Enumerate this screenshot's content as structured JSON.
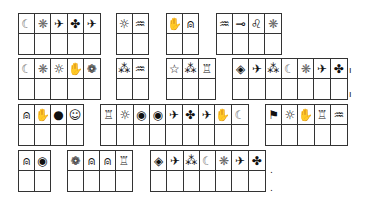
{
  "puzzle": {
    "cell_width": 16.6,
    "cell_height": 21,
    "boxes": [
      {
        "x": 18,
        "y": 13,
        "symbols": [
          "moon",
          "snowflake",
          "airplane",
          "clover",
          "airplane"
        ]
      },
      {
        "x": 116,
        "y": 13,
        "symbols": [
          "sun",
          "waves"
        ]
      },
      {
        "x": 166,
        "y": 13,
        "symbols": [
          "hand",
          "bell"
        ]
      },
      {
        "x": 216,
        "y": 13,
        "symbols": [
          "waves",
          "key",
          "leo",
          "snowflake"
        ]
      },
      {
        "x": 18,
        "y": 58,
        "symbols": [
          "moon",
          "snowflake",
          "sun",
          "hand",
          "flower"
        ]
      },
      {
        "x": 116,
        "y": 58,
        "symbols": [
          "three-stars",
          "waves"
        ]
      },
      {
        "x": 166,
        "y": 58,
        "symbols": [
          "star",
          "three-stars",
          "candle"
        ]
      },
      {
        "x": 232,
        "y": 58,
        "symbols": [
          "diamond",
          "airplane",
          "three-stars",
          "moon",
          "snowflake",
          "airplane",
          "clover"
        ]
      },
      {
        "x": 18,
        "y": 104,
        "symbols": [
          "bell",
          "hand",
          "drop",
          "smiley"
        ]
      },
      {
        "x": 100,
        "y": 104,
        "symbols": [
          "candle",
          "sun",
          "eye",
          "eye",
          "airplane",
          "clover",
          "airplane",
          "hand",
          "moon"
        ]
      },
      {
        "x": 265,
        "y": 104,
        "symbols": [
          "flag",
          "sun",
          "hand",
          "candle",
          "waves"
        ]
      },
      {
        "x": 18,
        "y": 150,
        "symbols": [
          "bell",
          "eye"
        ]
      },
      {
        "x": 67,
        "y": 150,
        "symbols": [
          "flower",
          "bell",
          "bell",
          "candle"
        ]
      },
      {
        "x": 150,
        "y": 150,
        "symbols": [
          "diamond",
          "airplane",
          "three-stars",
          "moon",
          "snowflake",
          "airplane",
          "clover"
        ]
      }
    ],
    "glyphs": {
      "moon": "☾",
      "snowflake": "❋",
      "airplane": "✈",
      "clover": "✤",
      "sun": "☼",
      "waves": "♒",
      "hand": "✋",
      "bell": "⍝",
      "key": "⊸",
      "leo": "♌",
      "flower": "❁",
      "three-stars": "⁂",
      "star": "☆",
      "candle": "♖",
      "diamond": "◈",
      "drop": "●",
      "smiley": "☺",
      "eye": "◉",
      "flag": "⚑"
    },
    "marks": [
      {
        "x": 349,
        "y": 66,
        "text": "ı"
      },
      {
        "x": 349,
        "y": 90,
        "text": "ı"
      },
      {
        "x": 270,
        "y": 166,
        "text": "."
      },
      {
        "x": 270,
        "y": 184,
        "text": "."
      }
    ]
  }
}
